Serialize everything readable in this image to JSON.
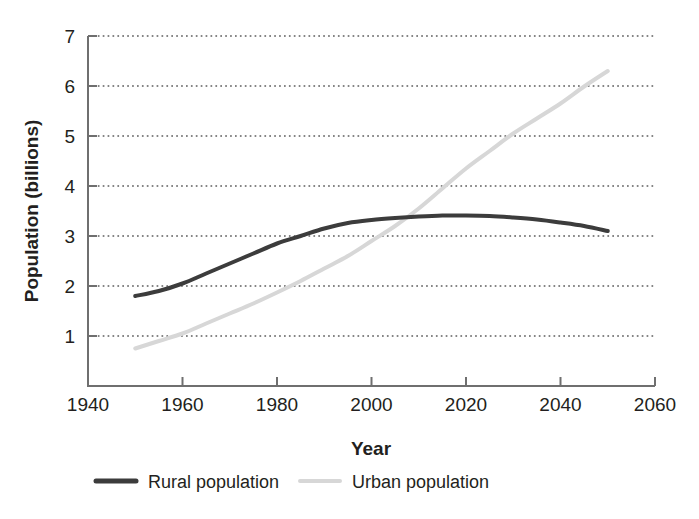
{
  "chart_data": {
    "type": "line",
    "title": "",
    "xlabel": "Year",
    "ylabel": "Population (billions)",
    "xlim": [
      1940,
      2060
    ],
    "ylim": [
      0,
      7
    ],
    "xticks": [
      1940,
      1960,
      1980,
      2000,
      2020,
      2040,
      2060
    ],
    "yticks": [
      1,
      2,
      3,
      4,
      5,
      6,
      7
    ],
    "grid": "horizontal-dotted",
    "legend_position": "bottom-center",
    "series": [
      {
        "name": "Rural population",
        "color": "#3c3c3c",
        "width": 4,
        "x": [
          1950,
          1955,
          1960,
          1965,
          1970,
          1975,
          1980,
          1985,
          1990,
          1995,
          2000,
          2005,
          2010,
          2015,
          2020,
          2025,
          2030,
          2035,
          2040,
          2045,
          2050
        ],
        "values": [
          1.8,
          1.9,
          2.05,
          2.25,
          2.45,
          2.65,
          2.85,
          3.0,
          3.15,
          3.26,
          3.32,
          3.36,
          3.39,
          3.41,
          3.41,
          3.4,
          3.37,
          3.33,
          3.27,
          3.2,
          3.1
        ]
      },
      {
        "name": "Urban population",
        "color": "#d7d7d7",
        "width": 4,
        "x": [
          1950,
          1955,
          1960,
          1965,
          1970,
          1975,
          1980,
          1985,
          1990,
          1995,
          2000,
          2005,
          2010,
          2015,
          2020,
          2025,
          2030,
          2035,
          2040,
          2045,
          2050
        ],
        "values": [
          0.75,
          0.9,
          1.05,
          1.25,
          1.45,
          1.65,
          1.87,
          2.1,
          2.35,
          2.6,
          2.9,
          3.2,
          3.55,
          3.95,
          4.35,
          4.7,
          5.05,
          5.35,
          5.65,
          5.99,
          6.3
        ]
      }
    ],
    "annotations": []
  },
  "legend": {
    "entries": [
      {
        "label": "Rural population",
        "swatch": "rural-line-swatch"
      },
      {
        "label": "Urban population",
        "swatch": "urban-line-swatch"
      }
    ]
  },
  "colors": {
    "rural": "#3c3c3c",
    "urban": "#d7d7d7",
    "axis": "#6f6f6f",
    "text": "#231f20",
    "grid": "#5d5d5d",
    "background": "#ffffff"
  }
}
